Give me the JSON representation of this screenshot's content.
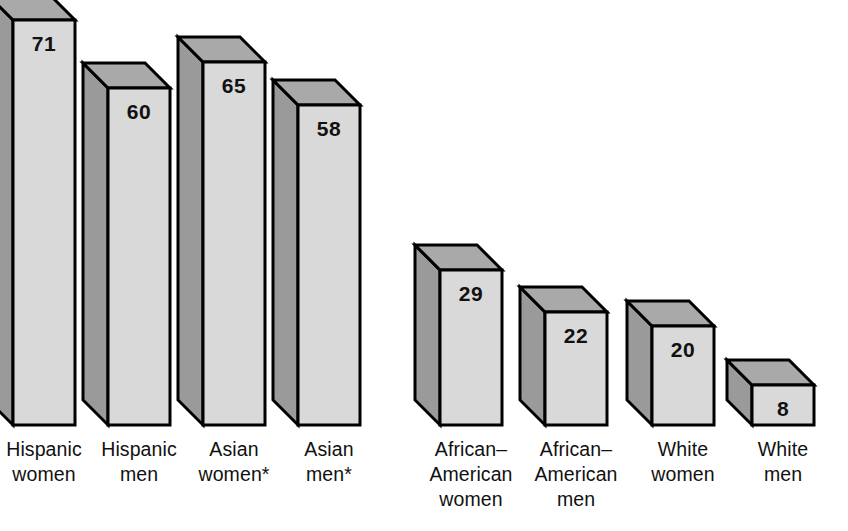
{
  "chart_data": {
    "type": "bar",
    "title": "",
    "subtitle": "",
    "xlabel": "",
    "ylabel": "",
    "grid": false,
    "legend": "none",
    "style": "3d-isometric-bars",
    "ylim": [
      0,
      75
    ],
    "categories": [
      "Hispanic\nwomen",
      "Hispanic\nmen",
      "Asian\nwomen*",
      "Asian\nmen*",
      "African–\nAmerican\nwomen",
      "African–\nAmerican\nmen",
      "White\nwomen",
      "White\nmen"
    ],
    "values": [
      71,
      60,
      65,
      58,
      29,
      22,
      20,
      8
    ],
    "value_labels": [
      "71",
      "60",
      "65",
      "58",
      "29",
      "22",
      "20",
      "8"
    ],
    "footnote": "*"
  },
  "colors": {
    "front_face": "#d9d9d9",
    "side_face": "#9a9a9a",
    "top_face": "#a9a9a9",
    "outline": "#000000",
    "label_text": "#111111",
    "background": "#ffffff"
  },
  "bars": [
    {
      "name": "hispanic-women",
      "label": "Hispanic\nwomen",
      "value": "71",
      "x": 13,
      "top": 20
    },
    {
      "name": "hispanic-men",
      "label": "Hispanic\nmen",
      "value": "60",
      "x": 108,
      "top": 88
    },
    {
      "name": "asian-women",
      "label": "Asian\nwomen*",
      "value": "65",
      "x": 203,
      "top": 62
    },
    {
      "name": "asian-men",
      "label": "Asian\nmen*",
      "value": "58",
      "x": 298,
      "top": 105
    },
    {
      "name": "african-american-women",
      "label": "African–\nAmerican\nwomen",
      "value": "29",
      "x": 440,
      "top": 270
    },
    {
      "name": "african-american-men",
      "label": "African–\nAmerican\nmen",
      "value": "22",
      "x": 545,
      "top": 312
    },
    {
      "name": "white-women",
      "label": "White\nwomen",
      "value": "20",
      "x": 652,
      "top": 326
    },
    {
      "name": "white-men",
      "label": "White\nmen",
      "value": "8",
      "x": 752,
      "top": 385
    }
  ]
}
